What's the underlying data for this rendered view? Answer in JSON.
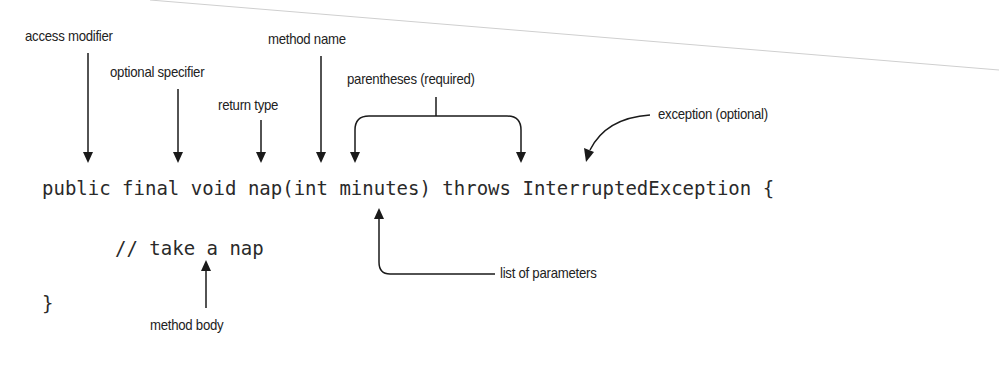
{
  "code": {
    "line1": "public final void nap(int minutes) throws InterruptedException {",
    "line2": "// take a nap",
    "line3": "}"
  },
  "labels": {
    "access_modifier": "access modifier",
    "optional_specifier": "optional specifier",
    "return_type": "return type",
    "method_name": "method name",
    "parentheses": "parentheses (required)",
    "exception": "exception (optional)",
    "parameters": "list of parameters",
    "method_body": "method body"
  },
  "colors": {
    "text": "#222222",
    "arrow": "#1a1a1a",
    "background": "#ffffff"
  }
}
